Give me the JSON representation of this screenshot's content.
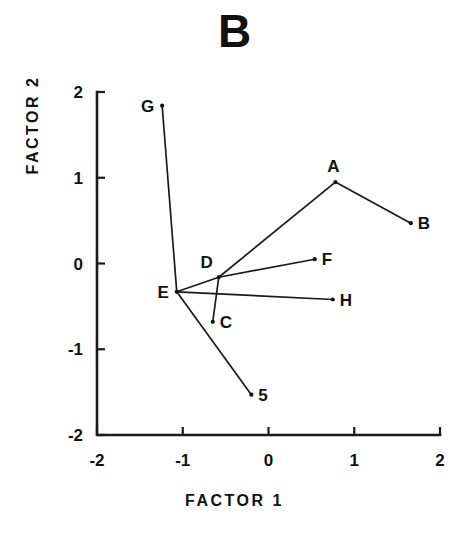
{
  "chart_data": {
    "type": "scatter",
    "title": "B",
    "xlabel": "FACTOR 1",
    "ylabel": "FACTOR 2",
    "xlim": [
      -2,
      2
    ],
    "ylim": [
      -2,
      2
    ],
    "xticks": [
      "-2",
      "-1",
      "0",
      "1",
      "2"
    ],
    "yticks": [
      "-2",
      "-1",
      "0",
      "1",
      "2"
    ],
    "xtick_values": [
      -2,
      -1,
      0,
      1,
      2
    ],
    "ytick_values": [
      -2,
      -1,
      0,
      1,
      2
    ],
    "grid": false,
    "legend": null,
    "points": [
      {
        "label": "A",
        "x": 0.78,
        "y": 0.95,
        "label_pos": "above"
      },
      {
        "label": "B",
        "x": 1.66,
        "y": 0.47,
        "label_pos": "right"
      },
      {
        "label": "C",
        "x": -0.65,
        "y": -0.68,
        "label_pos": "right"
      },
      {
        "label": "D",
        "x": -0.58,
        "y": -0.16,
        "label_pos": "above-left"
      },
      {
        "label": "E",
        "x": -1.07,
        "y": -0.33,
        "label_pos": "left"
      },
      {
        "label": "F",
        "x": 0.54,
        "y": 0.05,
        "label_pos": "right"
      },
      {
        "label": "G",
        "x": -1.24,
        "y": 1.84,
        "label_pos": "left"
      },
      {
        "label": "H",
        "x": 0.75,
        "y": -0.42,
        "label_pos": "right"
      },
      {
        "label": "5",
        "x": -0.2,
        "y": -1.53,
        "label_pos": "right"
      }
    ],
    "edges": [
      {
        "from": "G",
        "to": "E"
      },
      {
        "from": "E",
        "to": "D"
      },
      {
        "from": "E",
        "to": "H"
      },
      {
        "from": "E",
        "to": "5"
      },
      {
        "from": "D",
        "to": "A"
      },
      {
        "from": "D",
        "to": "F"
      },
      {
        "from": "D",
        "to": "C"
      },
      {
        "from": "A",
        "to": "B"
      }
    ],
    "colors": {
      "ink": "#1a1a1a",
      "background": "#ffffff"
    }
  }
}
